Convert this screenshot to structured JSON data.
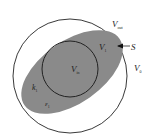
{
  "diagram": {
    "labels": {
      "v_out": {
        "main": "V",
        "sub": "out"
      },
      "v_1": {
        "main": "V",
        "sub": "1"
      },
      "s": {
        "main": "S"
      },
      "v_0": {
        "main": "V",
        "sub": "0"
      },
      "v_in": {
        "main": "V",
        "sub": "in"
      },
      "k_1": {
        "main": "k",
        "sub": "1"
      },
      "eps_1": {
        "main": "ε",
        "sub": "1"
      }
    },
    "colors": {
      "ellipse_fill": "#8a8a8a",
      "outline": "#222222",
      "background": "#ffffff"
    }
  }
}
